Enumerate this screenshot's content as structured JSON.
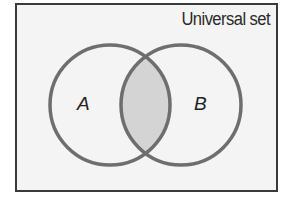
{
  "diagram": {
    "type": "venn",
    "universal_set_label": "Universal set",
    "sets": [
      {
        "id": "A",
        "label": "A",
        "cx": 110,
        "cy": 105,
        "r": 60
      },
      {
        "id": "B",
        "label": "B",
        "cx": 181,
        "cy": 105,
        "r": 60
      }
    ],
    "highlighted_region": "A ∩ B",
    "colors": {
      "frame_border": "#3a3a3a",
      "frame_background": "#f4f4f4",
      "circle_stroke": "#6e6e6e",
      "intersection_fill": "#d4d4d4",
      "text": "#222222"
    }
  }
}
